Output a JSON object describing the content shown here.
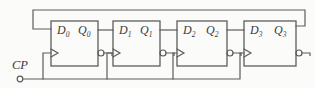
{
  "colors": {
    "line": "#5c5c5c",
    "text": "#3a3a3a",
    "background": "#fbfbf9"
  },
  "clock": {
    "label": "CP"
  },
  "flipflops": [
    {
      "d": "D",
      "d_sub": "0",
      "q": "Q",
      "q_sub": "0"
    },
    {
      "d": "D",
      "d_sub": "1",
      "q": "Q",
      "q_sub": "1"
    },
    {
      "d": "D",
      "d_sub": "2",
      "q": "Q",
      "q_sub": "2"
    },
    {
      "d": "D",
      "d_sub": "3",
      "q": "Q",
      "q_sub": "3"
    }
  ]
}
